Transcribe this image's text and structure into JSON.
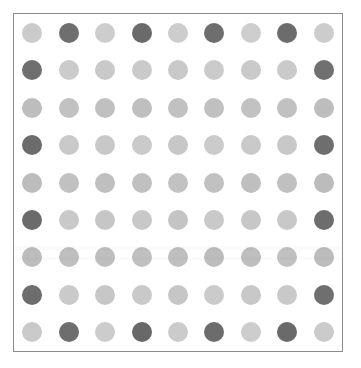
{
  "figure": {
    "background_color": "#ffffff",
    "frame": {
      "border_color": "#8c8c8c",
      "border_width_px": 1,
      "fill_color": "#ffffff",
      "x": 13,
      "y": 13,
      "width": 330,
      "height": 339
    }
  },
  "palette": {
    "light": "#cbcbcb",
    "light_alt": "#c6c6c6",
    "medium_light": "#bdbdbd",
    "medium": "#b5b5b5",
    "dark": "#6f6f6f",
    "dark_alt": "#737373",
    "darkest": "#686868"
  },
  "chart_data": {
    "type": "heatmap",
    "title": "",
    "subtitle": "",
    "xlabel": "",
    "ylabel": "",
    "marker": "circle",
    "marker_diameter_px": 20,
    "rows": 9,
    "cols": 9,
    "x": [
      1,
      2,
      3,
      4,
      5,
      6,
      7,
      8,
      9
    ],
    "y": [
      1,
      2,
      3,
      4,
      5,
      6,
      7,
      8,
      9
    ],
    "xticklabels": [],
    "yticklabels": [],
    "grid": false,
    "legend": null,
    "colorbar": null,
    "value_scale": {
      "min": 0,
      "max": 1,
      "description": "0 = light gray, 1 = dark gray"
    },
    "values": [
      [
        0.18,
        0.85,
        0.15,
        0.92,
        0.16,
        0.88,
        0.14,
        0.9,
        0.17
      ],
      [
        0.86,
        0.12,
        0.1,
        0.11,
        0.13,
        0.1,
        0.11,
        0.12,
        0.84
      ],
      [
        0.26,
        0.22,
        0.24,
        0.25,
        0.23,
        0.24,
        0.22,
        0.23,
        0.26
      ],
      [
        0.9,
        0.13,
        0.14,
        0.12,
        0.15,
        0.11,
        0.13,
        0.14,
        0.88
      ],
      [
        0.27,
        0.23,
        0.25,
        0.24,
        0.22,
        0.23,
        0.25,
        0.24,
        0.27
      ],
      [
        0.91,
        0.13,
        0.16,
        0.14,
        0.18,
        0.13,
        0.15,
        0.14,
        0.89
      ],
      [
        0.26,
        0.24,
        0.25,
        0.23,
        0.24,
        0.26,
        0.25,
        0.22,
        0.27
      ],
      [
        0.89,
        0.12,
        0.15,
        0.13,
        0.16,
        0.11,
        0.14,
        0.13,
        0.87
      ],
      [
        0.19,
        0.86,
        0.16,
        0.93,
        0.17,
        0.89,
        0.15,
        0.91,
        0.18
      ]
    ],
    "cell_colors": [
      [
        "#cbcbcb",
        "#6f6f6f",
        "#cdcdcd",
        "#6a6a6a",
        "#cdcdcd",
        "#6e6e6e",
        "#cecece",
        "#6c6c6c",
        "#cccccc"
      ],
      [
        "#6f6f6f",
        "#cbcbcb",
        "#c9c9c9",
        "#cacaca",
        "#c9c9c9",
        "#cbcbcb",
        "#cacaca",
        "#cacaca",
        "#707070"
      ],
      [
        "#bdbdbd",
        "#c2c2c2",
        "#c0c0c0",
        "#bfbfbf",
        "#c1c1c1",
        "#c0c0c0",
        "#c2c2c2",
        "#c1c1c1",
        "#bdbdbd"
      ],
      [
        "#6c6c6c",
        "#c9c9c9",
        "#c8c8c8",
        "#cacaca",
        "#c7c7c7",
        "#cbcbcb",
        "#c9c9c9",
        "#c8c8c8",
        "#6e6e6e"
      ],
      [
        "#bcbcbc",
        "#c1c1c1",
        "#bfbfbf",
        "#c0c0c0",
        "#c2c2c2",
        "#c1c1c1",
        "#bfbfbf",
        "#c0c0c0",
        "#bcbcbc"
      ],
      [
        "#6b6b6b",
        "#c9c9c9",
        "#c6c6c6",
        "#c8c8c8",
        "#c4c4c4",
        "#c9c9c9",
        "#c7c7c7",
        "#c8c8c8",
        "#6d6d6d"
      ],
      [
        "#bdbdbd",
        "#bfbfbf",
        "#bebebe",
        "#c0c0c0",
        "#bfbfbf",
        "#bdbdbd",
        "#bebebe",
        "#c1c1c1",
        "#bcbcbc"
      ],
      [
        "#6d6d6d",
        "#cacaca",
        "#c7c7c7",
        "#c9c9c9",
        "#c6c6c6",
        "#cbcbcb",
        "#c8c8c8",
        "#c9c9c9",
        "#6f6f6f"
      ],
      [
        "#cacaca",
        "#6e6e6e",
        "#cccccc",
        "#686868",
        "#cbcbcb",
        "#6c6c6c",
        "#cdcdcd",
        "#6a6a6a",
        "#cbcbcb"
      ]
    ]
  },
  "artifacts": [
    {
      "name": "scan-band-upper",
      "top_px": 232,
      "height_px": 4,
      "color": "rgba(0,0,0,0.020)"
    },
    {
      "name": "scan-band-lower",
      "top_px": 243,
      "height_px": 3,
      "color": "rgba(0,0,0,0.016)"
    }
  ]
}
